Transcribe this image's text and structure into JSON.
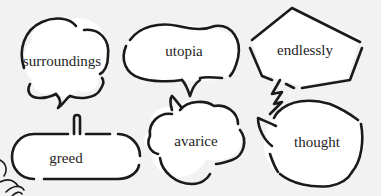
{
  "bubbles": [
    {
      "id": "surroundings",
      "label": "surroundings",
      "shape": "cloud-thought",
      "tail": "bottom-center-squiggle"
    },
    {
      "id": "utopia",
      "label": "utopia",
      "shape": "pear-oval",
      "tail": "bottom-left-hook"
    },
    {
      "id": "endlessly",
      "label": "endlessly",
      "shape": "pentagon",
      "tail": "lightning-bolt-bottom-left"
    },
    {
      "id": "greed",
      "label": "greed",
      "shape": "rounded-rectangle",
      "tail": "top-center-stem"
    },
    {
      "id": "avarice",
      "label": "avarice",
      "shape": "cloud",
      "tail": "top-left-hook"
    },
    {
      "id": "thought",
      "label": "thought",
      "shape": "circle",
      "tail": "left-hook"
    }
  ],
  "colors": {
    "background": "#f2f2f2",
    "bubble_fill": "#ffffff",
    "outline": "#1a1a1a",
    "text": "#1e1e1e"
  }
}
